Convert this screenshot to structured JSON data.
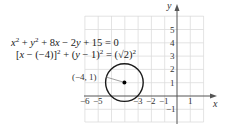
{
  "figure": {
    "equation_general": {
      "parts": [
        "x",
        "2",
        " + ",
        "y",
        "2",
        " + 8",
        "x",
        " − 2",
        "y",
        " + 15 = 0"
      ]
    },
    "equation_standard": {
      "parts": [
        "[",
        "x",
        " − (−4)]",
        "2",
        " + (",
        "y",
        " − 1)",
        "2",
        " = (√2)",
        "2"
      ]
    },
    "center_label": "(−4, 1)",
    "axes": {
      "x_label": "x",
      "y_label": "y",
      "x_ticks": [
        "−6",
        "−5",
        "−3",
        "−2",
        "−1",
        "1"
      ],
      "y_ticks": [
        "5",
        "4",
        "3",
        "2",
        "1",
        "−1"
      ]
    },
    "circle": {
      "center": [
        -4,
        1
      ],
      "radius": "√2"
    },
    "colors": {
      "grid": "#d9d9d9",
      "axis": "#555555",
      "circle": "#1a1a1a"
    }
  }
}
